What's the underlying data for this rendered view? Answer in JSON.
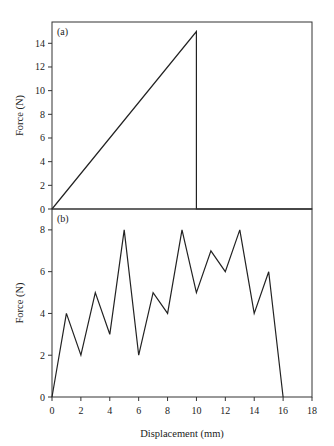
{
  "figure": {
    "xlabel": "Displacement (mm)",
    "x_ticks": [
      0,
      2,
      4,
      6,
      8,
      10,
      12,
      14,
      16,
      18
    ]
  },
  "panels": [
    {
      "tag": "(a)",
      "ylabel": "Force (N)",
      "y_ticks": [
        0,
        2,
        4,
        6,
        8,
        10,
        12,
        14
      ]
    },
    {
      "tag": "(b)",
      "ylabel": "Force (N)",
      "y_ticks": [
        0,
        2,
        4,
        6,
        8
      ]
    }
  ],
  "chart_data": [
    {
      "type": "line",
      "title": "(a)",
      "xlabel": "Displacement (mm)",
      "ylabel": "Force (N)",
      "xlim": [
        0,
        18
      ],
      "ylim": [
        0,
        15.8
      ],
      "x_ticks": [
        0,
        2,
        4,
        6,
        8,
        10,
        12,
        14,
        16,
        18
      ],
      "y_ticks": [
        0,
        2,
        4,
        6,
        8,
        10,
        12,
        14
      ],
      "grid": false,
      "legend": null,
      "series": [
        {
          "name": "Force",
          "x": [
            0,
            10,
            10,
            18
          ],
          "y": [
            0,
            15,
            0,
            0
          ]
        }
      ]
    },
    {
      "type": "line",
      "title": "(b)",
      "xlabel": "Displacement (mm)",
      "ylabel": "Force (N)",
      "xlim": [
        0,
        18
      ],
      "ylim": [
        0,
        9
      ],
      "x_ticks": [
        0,
        2,
        4,
        6,
        8,
        10,
        12,
        14,
        16,
        18
      ],
      "y_ticks": [
        0,
        2,
        4,
        6,
        8
      ],
      "grid": false,
      "legend": null,
      "series": [
        {
          "name": "Force",
          "x": [
            0,
            1,
            2,
            3,
            4,
            5,
            6,
            7,
            8,
            9,
            10,
            11,
            12,
            13,
            14,
            15,
            16
          ],
          "y": [
            0,
            4,
            2,
            5,
            3,
            8,
            2,
            5,
            4,
            8,
            5,
            7,
            6,
            8,
            4,
            6,
            0
          ]
        }
      ]
    }
  ]
}
